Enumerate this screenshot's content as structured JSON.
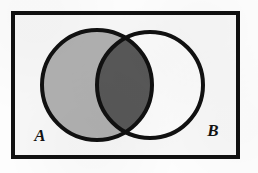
{
  "figure": {
    "kind": "venn-diagram",
    "labels": {
      "left_set": "A",
      "right_set": "B"
    },
    "colors": {
      "stroke": "#111111",
      "universe_fill": "#f7f7f7",
      "page_background": "#fdfdfd",
      "set_a_only_fill": "#b0b0b0",
      "set_b_only_fill": "#fbfbfb",
      "intersection_fill": "#585858"
    },
    "geometry": {
      "universe_rect": {
        "x": 13,
        "y": 13,
        "width": 225,
        "height": 144,
        "stroke_width": 4
      },
      "circle_a": {
        "cx": 97,
        "cy": 85,
        "r": 55,
        "stroke_width": 4
      },
      "circle_b": {
        "cx": 150,
        "cy": 85,
        "r": 53,
        "stroke_width": 4
      },
      "label_a_position": {
        "x": 40,
        "y": 141
      },
      "label_b_position": {
        "x": 213,
        "y": 136
      }
    }
  }
}
